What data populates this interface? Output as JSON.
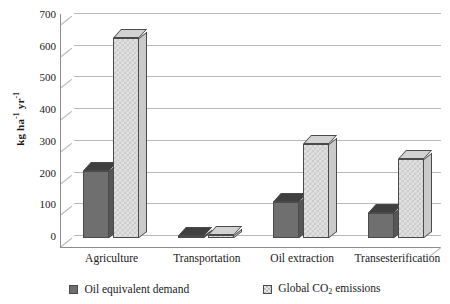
{
  "chart_data": {
    "type": "bar",
    "title": "",
    "xlabel": "",
    "ylabel": "kg ha-1 yr-1",
    "ylabel_parts": {
      "base1": "kg ha",
      "sup1": "-1",
      "base2": " yr",
      "sup2": "-1"
    },
    "categories": [
      "Agriculture",
      "Transportation",
      "Oil extraction",
      "Transesterification"
    ],
    "series": [
      {
        "name": "Oil equivalent demand",
        "color": "#6f6f6f",
        "values": [
          210,
          5,
          115,
          80
        ]
      },
      {
        "name": "Global CO2 emissions",
        "color": "#e2e2e2",
        "values": [
          630,
          8,
          295,
          250
        ]
      }
    ],
    "ylim": [
      0,
      700
    ],
    "yticks": [
      0,
      100,
      200,
      300,
      400,
      500,
      600,
      700
    ],
    "ytick_labels": [
      "0",
      "100",
      "200",
      "300",
      "400",
      "500",
      "600",
      "700"
    ],
    "grid": true,
    "legend_position": "bottom",
    "style": "3d-column"
  },
  "legend": {
    "items": [
      {
        "label": "Oil equivalent demand",
        "swatch": "dark-gray-square",
        "has_subscript": false
      },
      {
        "label_pre": "Global CO",
        "label_sub": "2",
        "label_post": " emissions",
        "swatch": "light-hatched-square",
        "has_subscript": true
      }
    ]
  }
}
